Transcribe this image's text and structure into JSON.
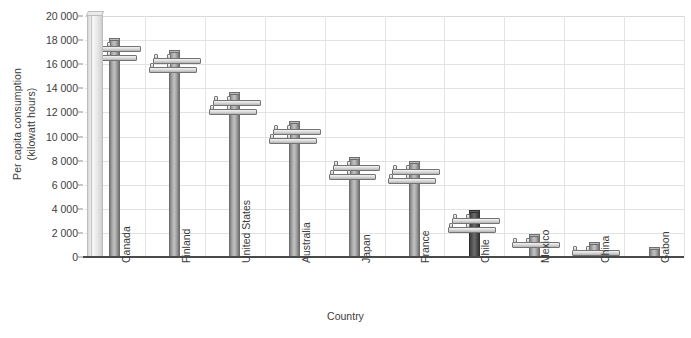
{
  "chart_data": {
    "type": "bar",
    "title": "",
    "xlabel": "Country",
    "ylabel": "Per capita consumption (kilowatt hours)",
    "ylabel_line1": "Per capita consumption",
    "ylabel_line2": "(kilowatt hours)",
    "categories": [
      "Canada",
      "Finland",
      "United States",
      "Australia",
      "Japan",
      "France",
      "Chile",
      "Mexico",
      "China",
      "Gabon"
    ],
    "values": [
      18200,
      17200,
      13700,
      11300,
      8300,
      8000,
      3900,
      1900,
      1250,
      800
    ],
    "ylim": [
      0,
      20000
    ],
    "ytick_values": [
      0,
      2000,
      4000,
      6000,
      8000,
      10000,
      12000,
      14000,
      16000,
      18000,
      20000
    ],
    "ytick_labels": [
      "0",
      "2 000",
      "4 000",
      "6 000",
      "8 000",
      "10 000",
      "12 000",
      "14 000",
      "16 000",
      "18 000",
      "20 000"
    ],
    "grid": true,
    "legend": "none",
    "bar_style": "utility-pole",
    "highlight_category": "Chile",
    "colors": {
      "bar": "#a9a9a9",
      "bar_highlight": "#4d4d4d",
      "gridline": "#e2e2e2",
      "axis": "#4a4a4a",
      "text": "#3c3c3c",
      "background": "#ffffff"
    }
  }
}
